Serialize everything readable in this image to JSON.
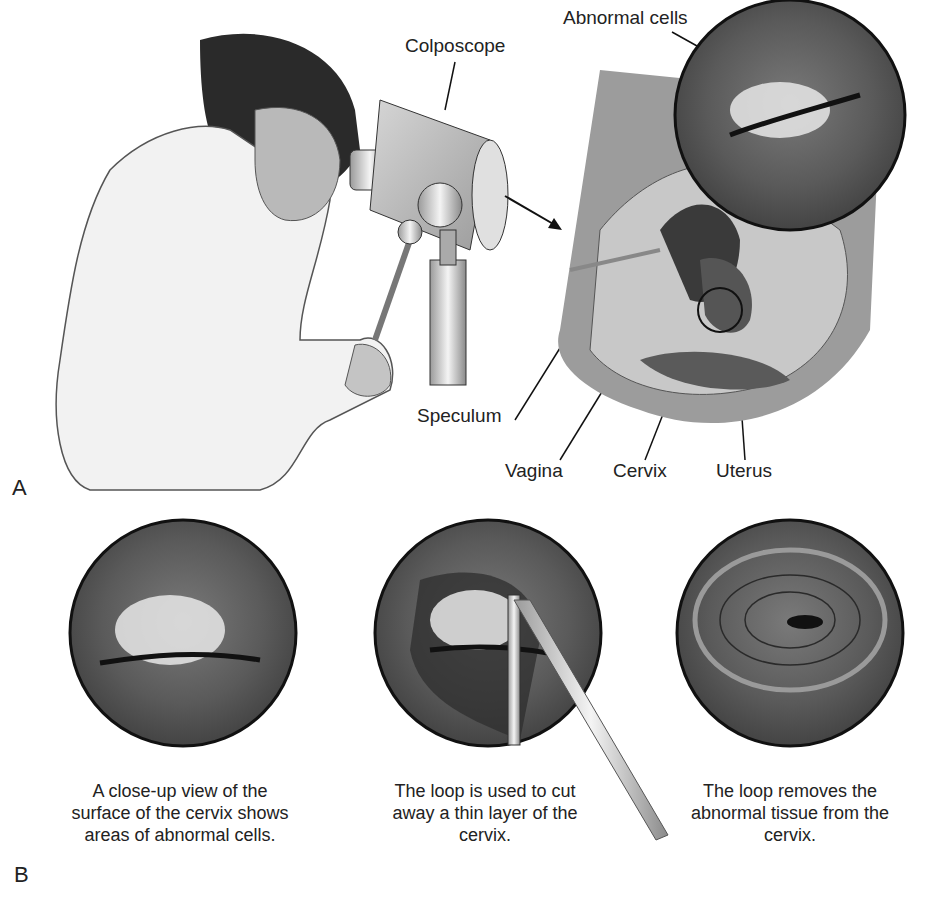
{
  "panel_a": {
    "letter": "A",
    "labels": {
      "abnormal_cells": "Abnormal cells",
      "colposcope": "Colposcope",
      "speculum": "Speculum",
      "vagina": "Vagina",
      "cervix": "Cervix",
      "uterus": "Uterus"
    }
  },
  "panel_b": {
    "letter": "B",
    "captions": [
      "A close-up view of the surface of the cervix shows areas of abnormal cells.",
      "The loop is used to cut away a thin layer of the cervix.",
      "The loop removes the abnormal tissue from the cervix."
    ]
  },
  "colors": {
    "tissue_dark": "#4a4a4a",
    "tissue_mid": "#6e6e6e",
    "coat": "#f2f2f2",
    "outline": "#111111",
    "cells": "#e8e8e8"
  }
}
